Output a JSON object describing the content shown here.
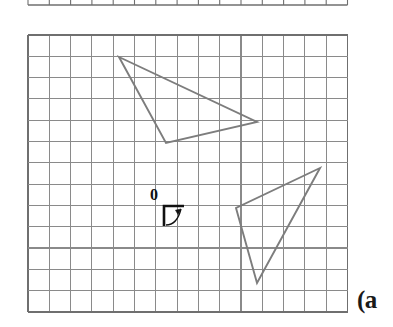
{
  "figure": {
    "kind": "grid-geometry-figure",
    "background": "#ffffff",
    "width": 393,
    "height": 327,
    "part_label": "(a",
    "part_label_position": {
      "x": 357,
      "y": 287
    },
    "origin": {
      "label": "0",
      "label_position": {
        "x": 150,
        "y": 187
      },
      "marker_description": "right-angle axis corner with curved rotation arrow",
      "corner": {
        "x": 164,
        "y": 206
      },
      "horizontal_end": {
        "x": 184,
        "y": 206
      },
      "vertical_end": {
        "x": 164,
        "y": 226
      },
      "arrow_tip": {
        "x": 181,
        "y": 206
      }
    },
    "grid": {
      "x0": 28,
      "y0": 35,
      "cols": 15,
      "rows": 13,
      "cell": 21.3,
      "line_color": "#8a8a8a",
      "border_color": "#6f6f6f",
      "line_width": 1.1,
      "border_width": 1.4
    },
    "top_strip": {
      "description": "bottom edge of an adjacent grid cropped at top of image",
      "x0": 28,
      "cols": 15,
      "cell": 21.3,
      "baseline_y": 5,
      "tick_top_y": 0,
      "line_color": "#6f6f6f"
    },
    "shapes": [
      {
        "name": "upper-left-triangle",
        "type": "triangle",
        "stroke": "#7d7d7d",
        "stroke_width": 1.9,
        "fill": "none",
        "vertices": [
          {
            "x": 119,
            "y": 57
          },
          {
            "x": 257,
            "y": 122
          },
          {
            "x": 166,
            "y": 143
          }
        ]
      },
      {
        "name": "lower-right-triangle",
        "type": "triangle",
        "stroke": "#7d7d7d",
        "stroke_width": 1.9,
        "fill": "none",
        "vertices": [
          {
            "x": 320,
            "y": 168
          },
          {
            "x": 236,
            "y": 208
          },
          {
            "x": 257,
            "y": 283
          }
        ]
      }
    ]
  }
}
